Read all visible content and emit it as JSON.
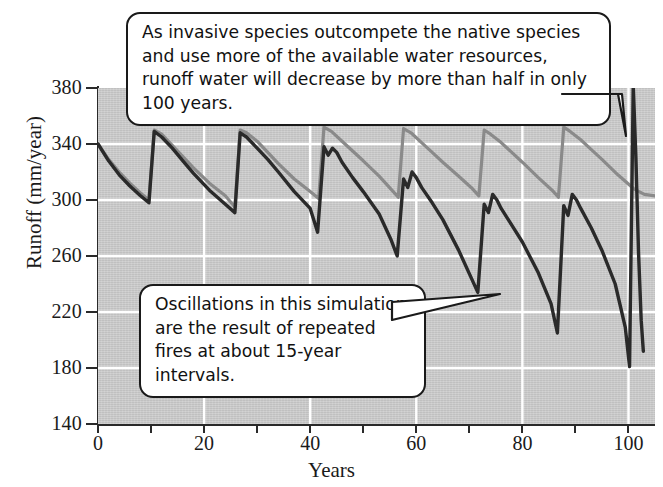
{
  "figure": {
    "background_color": "#cbcbcb",
    "gridline_color": "#ffffff",
    "axis_color": "#2a2a2a"
  },
  "annotations": {
    "top_callout": "As invasive species outcompete the native species and use more of the available water resources, runoff water will decrease by more than half in only 100 years.",
    "bottom_callout": "Oscillations in this simulation are the result of repeated fires at about 15-year intervals."
  },
  "chart_data": {
    "type": "line",
    "title": "",
    "xlabel": "Years",
    "ylabel": "Runoff (mm/year)",
    "xlim": [
      0,
      105
    ],
    "ylim": [
      140,
      380
    ],
    "x_ticks": [
      0,
      10,
      20,
      30,
      40,
      50,
      60,
      70,
      80,
      90,
      100
    ],
    "x_tick_labels": [
      "0",
      "",
      "20",
      "",
      "40",
      "",
      "60",
      "",
      "80",
      "",
      "100"
    ],
    "y_ticks": [
      140,
      180,
      220,
      260,
      300,
      340,
      380
    ],
    "y_tick_labels": [
      "140",
      "180",
      "220",
      "260",
      "300",
      "340",
      "380"
    ],
    "x_gridlines": [
      20,
      40,
      60,
      80,
      100
    ],
    "y_gridlines": [
      180,
      220,
      260,
      300,
      340
    ],
    "grid": true,
    "legend": false,
    "series": [
      {
        "name": "native-vegetation-runoff",
        "color": "#8a8a8a",
        "width": 3.2,
        "points": [
          [
            0,
            340
          ],
          [
            2,
            329
          ],
          [
            4,
            320
          ],
          [
            6,
            312
          ],
          [
            8,
            305
          ],
          [
            9.6,
            300
          ],
          [
            10.6,
            350
          ],
          [
            12,
            347
          ],
          [
            14,
            339
          ],
          [
            16,
            331
          ],
          [
            18,
            323
          ],
          [
            21,
            312
          ],
          [
            24,
            303
          ],
          [
            25.8,
            295
          ],
          [
            26.8,
            350
          ],
          [
            28,
            348
          ],
          [
            30,
            342
          ],
          [
            32,
            334
          ],
          [
            34,
            326
          ],
          [
            37,
            315
          ],
          [
            40,
            306
          ],
          [
            41.6,
            301
          ],
          [
            42.6,
            352
          ],
          [
            44,
            349
          ],
          [
            46,
            342
          ],
          [
            48,
            335
          ],
          [
            50,
            328
          ],
          [
            53,
            317
          ],
          [
            55.4,
            307
          ],
          [
            56.6,
            302
          ],
          [
            57.6,
            351
          ],
          [
            59,
            348
          ],
          [
            61,
            341
          ],
          [
            63,
            334
          ],
          [
            65,
            327
          ],
          [
            68,
            317
          ],
          [
            70.6,
            308
          ],
          [
            71.8,
            303
          ],
          [
            72.8,
            350
          ],
          [
            74,
            347
          ],
          [
            76,
            341
          ],
          [
            78,
            334
          ],
          [
            80,
            327
          ],
          [
            83,
            316
          ],
          [
            85.6,
            307
          ],
          [
            86.8,
            302
          ],
          [
            87.8,
            352
          ],
          [
            89,
            349
          ],
          [
            91,
            343
          ],
          [
            93,
            336
          ],
          [
            95,
            329
          ],
          [
            98,
            318
          ],
          [
            101,
            308
          ],
          [
            103,
            304
          ],
          [
            105,
            303
          ]
        ]
      },
      {
        "name": "invasive-species-runoff",
        "color": "#2a2a2a",
        "width": 3.4,
        "points": [
          [
            0,
            340
          ],
          [
            2,
            328
          ],
          [
            4,
            318
          ],
          [
            6,
            310
          ],
          [
            8,
            303
          ],
          [
            9.6,
            298
          ],
          [
            10.6,
            349
          ],
          [
            12,
            345
          ],
          [
            14,
            337
          ],
          [
            16,
            328
          ],
          [
            18,
            319
          ],
          [
            21,
            307
          ],
          [
            24,
            297
          ],
          [
            25.8,
            291
          ],
          [
            26.8,
            348
          ],
          [
            28,
            345
          ],
          [
            30,
            337
          ],
          [
            32,
            329
          ],
          [
            34,
            320
          ],
          [
            37,
            306
          ],
          [
            40,
            294
          ],
          [
            41.4,
            277
          ],
          [
            42.6,
            338
          ],
          [
            43.4,
            332
          ],
          [
            44.2,
            337
          ],
          [
            45,
            334
          ],
          [
            46,
            327
          ],
          [
            48,
            316
          ],
          [
            50,
            306
          ],
          [
            53,
            290
          ],
          [
            55.2,
            272
          ],
          [
            56.4,
            260
          ],
          [
            57.6,
            315
          ],
          [
            58.4,
            309
          ],
          [
            59.2,
            320
          ],
          [
            60,
            316
          ],
          [
            61,
            309
          ],
          [
            63,
            298
          ],
          [
            65,
            286
          ],
          [
            68,
            264
          ],
          [
            70.4,
            244
          ],
          [
            71.6,
            234
          ],
          [
            72.8,
            297
          ],
          [
            73.6,
            291
          ],
          [
            74.4,
            304
          ],
          [
            75.2,
            300
          ],
          [
            76,
            294
          ],
          [
            78,
            282
          ],
          [
            80,
            270
          ],
          [
            83,
            248
          ],
          [
            85.4,
            226
          ],
          [
            86.6,
            205
          ],
          [
            87.8,
            296
          ],
          [
            88.6,
            289
          ],
          [
            89.4,
            304
          ],
          [
            90.2,
            300
          ],
          [
            91,
            294
          ],
          [
            93,
            280
          ],
          [
            95,
            264
          ],
          [
            97.5,
            240
          ],
          [
            99.4,
            209
          ],
          [
            100.2,
            181
          ],
          [
            100.9,
            382
          ],
          [
            101.4,
            330
          ],
          [
            101.9,
            262
          ],
          [
            102.4,
            214
          ],
          [
            102.8,
            192
          ]
        ]
      }
    ],
    "annotation_notes": [
      "Oscillations caused by repeated fires at about 15-year intervals",
      "Runoff decreases by more than half in only 100 years"
    ]
  }
}
